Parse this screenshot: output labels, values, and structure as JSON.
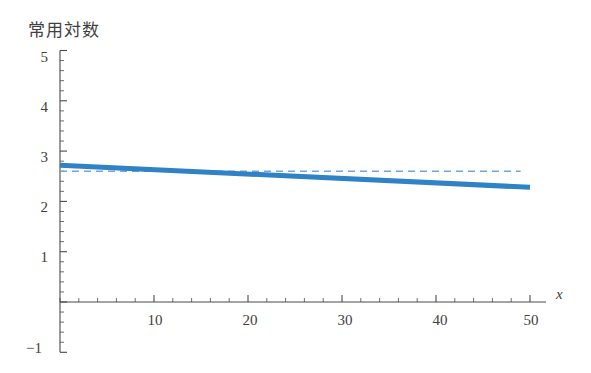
{
  "chart_data": {
    "type": "line",
    "title": "常用対数",
    "xlabel": "x",
    "ylabel": "",
    "xlim": [
      0,
      51
    ],
    "ylim": [
      -1,
      5
    ],
    "grid": false,
    "legend": null,
    "x_ticks": [
      10,
      20,
      30,
      40,
      50
    ],
    "x_tick_labels": [
      "10",
      "20",
      "30",
      "40",
      "50"
    ],
    "x_minor_step": 2,
    "y_ticks": [
      -1,
      1,
      2,
      3,
      4,
      5
    ],
    "y_tick_labels": [
      "-1",
      "1",
      "2",
      "3",
      "4",
      "5"
    ],
    "y_minor_step": 0.2,
    "series": [
      {
        "name": "solid-trend-line",
        "style": "solid",
        "color": "#2f82c6",
        "width": 5,
        "x": [
          0,
          50
        ],
        "values": [
          2.72,
          2.28
        ]
      },
      {
        "name": "dashed-reference-line",
        "style": "dashed",
        "color": "#6ea8dc",
        "width": 1.5,
        "x": [
          0,
          49
        ],
        "values": [
          2.6,
          2.6
        ]
      }
    ],
    "annotations": []
  },
  "labels": {
    "title": "常用対数",
    "x_axis": "x",
    "y_5": "5",
    "y_4": "4",
    "y_3": "3",
    "y_2": "2",
    "y_1": "1",
    "y_neg1": "−1",
    "x_10": "10",
    "x_20": "20",
    "x_30": "30",
    "x_40": "40",
    "x_50": "50"
  },
  "colors": {
    "solid_line": "#2f82c6",
    "dashed_line": "#6ea8dc",
    "axis": "#4a4a4a",
    "text": "#404040",
    "background": "#ffffff"
  }
}
